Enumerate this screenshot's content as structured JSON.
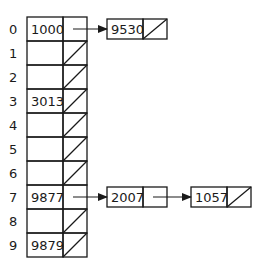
{
  "diagram": {
    "type": "hash-table-chaining",
    "table": {
      "indices": [
        "0",
        "1",
        "2",
        "3",
        "4",
        "5",
        "6",
        "7",
        "8",
        "9"
      ],
      "slots": [
        {
          "index": "0",
          "key": "1000",
          "has_next": true
        },
        {
          "index": "1",
          "key": "",
          "has_next": false
        },
        {
          "index": "2",
          "key": "",
          "has_next": false
        },
        {
          "index": "3",
          "key": "3013",
          "has_next": false
        },
        {
          "index": "4",
          "key": "",
          "has_next": false
        },
        {
          "index": "5",
          "key": "",
          "has_next": false
        },
        {
          "index": "6",
          "key": "",
          "has_next": false
        },
        {
          "index": "7",
          "key": "9877",
          "has_next": true
        },
        {
          "index": "8",
          "key": "",
          "has_next": false
        },
        {
          "index": "9",
          "key": "9879",
          "has_next": false
        }
      ]
    },
    "chains": [
      {
        "from_index": "0",
        "nodes": [
          {
            "key": "9530",
            "has_next": false
          }
        ]
      },
      {
        "from_index": "7",
        "nodes": [
          {
            "key": "2007",
            "has_next": true
          },
          {
            "key": "1057",
            "has_next": false
          }
        ]
      }
    ],
    "colors": {
      "stroke": "#1a1a1a",
      "background": "#ffffff"
    }
  }
}
